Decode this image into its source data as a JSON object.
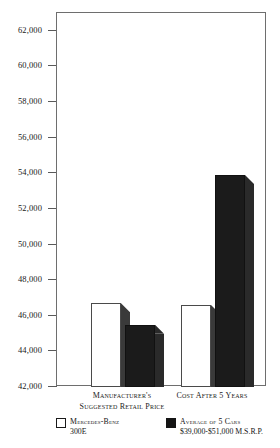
{
  "chart_data": {
    "type": "bar",
    "title": "",
    "xlabel": "",
    "ylabel": "",
    "ylim": [
      42000,
      63000
    ],
    "grid": false,
    "legend_position": "bottom",
    "categories": [
      "Manufacturer's Suggested Retail Price",
      "Cost After 5 Years"
    ],
    "category_lines": [
      [
        "Manufacturer's",
        "Suggested Retail Price"
      ],
      [
        "Cost After 5 Years",
        ""
      ]
    ],
    "yticks": [
      "42,000",
      "44,000",
      "46,000",
      "48,000",
      "50,000",
      "52,000",
      "54,000",
      "56,000",
      "58,000",
      "60,000",
      "62,000"
    ],
    "ytick_values": [
      42000,
      44000,
      46000,
      48000,
      50000,
      52000,
      54000,
      56000,
      58000,
      60000,
      62000
    ],
    "series": [
      {
        "name": "Mercedes-Benz 300E",
        "style": "light",
        "values": [
          46700,
          46600
        ]
      },
      {
        "name": "Average of 5 Cars $39,000-$51,000 M.S.R.P.",
        "style": "dark",
        "values": [
          45500,
          53900
        ]
      }
    ],
    "legend": [
      {
        "swatch": "light",
        "line1": "Mercedes-Benz",
        "line2": "300E"
      },
      {
        "swatch": "dark",
        "line1": "Average of 5 Cars",
        "line2": "$39,000-$51,000 M.S.R.P."
      }
    ],
    "colors": {
      "light_bar": "#ffffff",
      "dark_bar": "#1b1b1b",
      "side_face": "#3a3a3a",
      "axis": "#6e6e6e",
      "text": "#1a1a1a",
      "background": "#ffffff"
    }
  }
}
